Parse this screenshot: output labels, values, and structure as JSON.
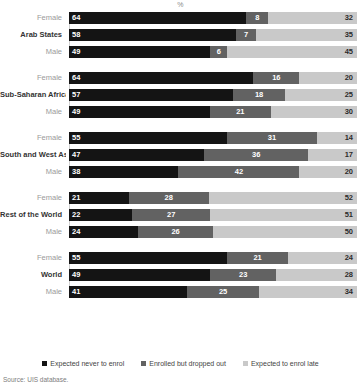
{
  "axis_unit": "%",
  "source_note": "Source: UIS database.",
  "colors": {
    "never": "#141414",
    "dropped": "#626262",
    "late": "#c9c9c9",
    "background": "#ffffff",
    "baseline": "#cfcfcf"
  },
  "legend": {
    "items": [
      {
        "label": "Expected never to enrol",
        "color": "#141414",
        "key": "never"
      },
      {
        "label": "Enrolled but dropped out",
        "color": "#626262",
        "key": "dropped"
      },
      {
        "label": "Expected to enrol late",
        "color": "#c9c9c9",
        "key": "late"
      }
    ]
  },
  "chart_data": {
    "type": "bar",
    "orientation": "horizontal",
    "stacked": true,
    "title": "",
    "xlabel": "%",
    "ylabel": "",
    "xlim": [
      0,
      100
    ],
    "grid": false,
    "legend_position": "bottom",
    "series": [
      {
        "name": "Expected never to enrol",
        "color": "#141414"
      },
      {
        "name": "Enrolled but dropped out",
        "color": "#626262"
      },
      {
        "name": "Expected to enrol late",
        "color": "#c9c9c9"
      }
    ],
    "groups": [
      {
        "region": "Arab States",
        "rows": [
          {
            "label": "Female",
            "is_region": false,
            "values": [
              64,
              8,
              32
            ]
          },
          {
            "label": "Arab States",
            "is_region": true,
            "values": [
              58,
              7,
              35
            ]
          },
          {
            "label": "Male",
            "is_region": false,
            "values": [
              49,
              6,
              45
            ]
          }
        ]
      },
      {
        "region": "Sub-Saharan Africa",
        "rows": [
          {
            "label": "Female",
            "is_region": false,
            "values": [
              64,
              16,
              20
            ]
          },
          {
            "label": "Sub-Saharan Africa",
            "is_region": true,
            "values": [
              57,
              18,
              25
            ]
          },
          {
            "label": "Male",
            "is_region": false,
            "values": [
              49,
              21,
              30
            ]
          }
        ]
      },
      {
        "region": "South and West Asia",
        "rows": [
          {
            "label": "Female",
            "is_region": false,
            "values": [
              55,
              31,
              14
            ]
          },
          {
            "label": "South and West Asia",
            "is_region": true,
            "values": [
              47,
              36,
              17
            ]
          },
          {
            "label": "Male",
            "is_region": false,
            "values": [
              38,
              42,
              20
            ]
          }
        ]
      },
      {
        "region": "Rest of the World",
        "rows": [
          {
            "label": "Female",
            "is_region": false,
            "values": [
              21,
              28,
              52
            ]
          },
          {
            "label": "Rest of the World",
            "is_region": true,
            "values": [
              22,
              27,
              51
            ]
          },
          {
            "label": "Male",
            "is_region": false,
            "values": [
              24,
              26,
              50
            ]
          }
        ]
      },
      {
        "region": "World",
        "rows": [
          {
            "label": "Female",
            "is_region": false,
            "values": [
              55,
              21,
              24
            ]
          },
          {
            "label": "World",
            "is_region": true,
            "values": [
              49,
              23,
              28
            ]
          },
          {
            "label": "Male",
            "is_region": false,
            "values": [
              41,
              25,
              34
            ]
          }
        ]
      }
    ]
  }
}
